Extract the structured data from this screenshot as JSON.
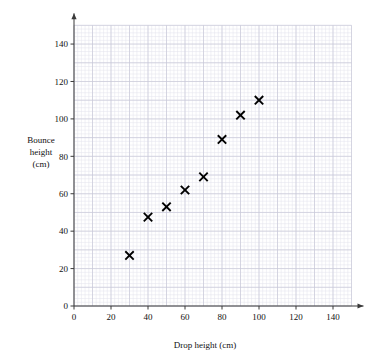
{
  "chart_data": {
    "type": "scatter",
    "title": "",
    "xlabel": "Drop height (cm)",
    "ylabel": "Bounce height (cm)",
    "ylabel_lines": [
      "Bounce",
      "height",
      "(cm)"
    ],
    "xlim": [
      0,
      150
    ],
    "ylim": [
      0,
      150
    ],
    "xticks": [
      0,
      20,
      40,
      60,
      80,
      100,
      120,
      140
    ],
    "yticks": [
      0,
      20,
      40,
      60,
      80,
      100,
      120,
      140
    ],
    "xtick_labels": [
      "0",
      "20",
      "40",
      "60",
      "80",
      "100",
      "120",
      "140"
    ],
    "ytick_labels": [
      "0",
      "20",
      "40",
      "60",
      "80",
      "100",
      "120",
      "140"
    ],
    "grid": true,
    "grid_major_step": 10,
    "grid_minor_step": 2,
    "legend": "none",
    "marker": "x",
    "marker_color": "#000000",
    "x": [
      30,
      40,
      50,
      60,
      70,
      80,
      90,
      100
    ],
    "y": [
      27,
      47.5,
      53,
      62,
      69,
      89,
      102,
      110
    ],
    "points": [
      {
        "x": 30,
        "y": 27
      },
      {
        "x": 40,
        "y": 47.5
      },
      {
        "x": 50,
        "y": 53
      },
      {
        "x": 60,
        "y": 62
      },
      {
        "x": 70,
        "y": 69
      },
      {
        "x": 80,
        "y": 89
      },
      {
        "x": 90,
        "y": 102
      },
      {
        "x": 100,
        "y": 110
      }
    ]
  },
  "axes": {
    "x_title": "Drop height (cm)",
    "y_title_line1": "Bounce",
    "y_title_line2": "height",
    "y_title_line3": "(cm)"
  },
  "colors": {
    "marker": "#000000",
    "axis": "#3a3a3a",
    "grid_major": "#c9c9d8",
    "grid_minor": "#e3e3ec",
    "background": "#ffffff"
  }
}
